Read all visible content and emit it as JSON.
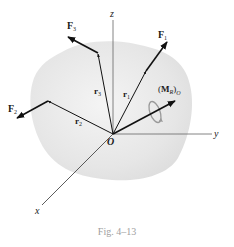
{
  "figure": {
    "caption": "Fig. 4–13",
    "origin_label": "O",
    "axes": {
      "x": "x",
      "y": "y",
      "z": "z"
    },
    "position_vectors": {
      "r1": "r",
      "r1_sub": "1",
      "r2": "r",
      "r2_sub": "2",
      "r3": "r",
      "r3_sub": "3"
    },
    "forces": {
      "F1": "F",
      "F1_sub": "1",
      "F2": "F",
      "F2_sub": "2",
      "F3": "F",
      "F3_sub": "3"
    },
    "moment": {
      "open": "(",
      "M": "M",
      "sub": "R",
      "close": ")",
      "outer_sub": "O"
    }
  },
  "colors": {
    "body_fill": "#e8e8e8",
    "vector": "#111111",
    "axis": "#555555",
    "moment_loop": "#9a9a9a",
    "caption": "#a0a0a0"
  }
}
